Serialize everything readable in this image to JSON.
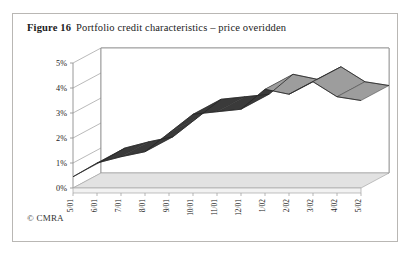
{
  "figure": {
    "number": "Figure 16",
    "title": "Portfolio credit characteristics – price overidden",
    "copyright": "© CMRA"
  },
  "chart_data": {
    "type": "line",
    "title": "Portfolio credit characteristics – price overidden",
    "xlabel": "",
    "ylabel": "",
    "ylim": [
      0,
      5
    ],
    "ytick_labels": [
      "0%",
      "1%",
      "2%",
      "3%",
      "4%",
      "5%"
    ],
    "ytick_values": [
      0,
      1,
      2,
      3,
      4,
      5
    ],
    "grid": true,
    "legend": false,
    "three_d": true,
    "series_color": "#4d4d4d",
    "categories": [
      "5/01",
      "6/01",
      "7/01",
      "8/01",
      "9/01",
      "10/01",
      "11/01",
      "12/01",
      "1/02",
      "2/02",
      "3/02",
      "4/02",
      "5/02"
    ],
    "series": [
      {
        "name": "Portfolio credit characteristics",
        "values": [
          0.45,
          1.0,
          1.25,
          1.45,
          2.2,
          2.95,
          3.05,
          3.15,
          3.95,
          3.75,
          4.25,
          3.65,
          3.5
        ]
      }
    ]
  }
}
